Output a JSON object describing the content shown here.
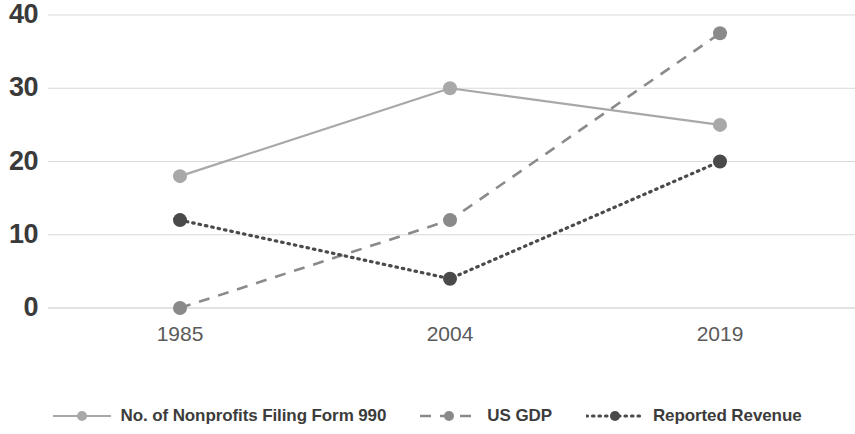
{
  "chart_data": {
    "type": "line",
    "title": "",
    "subtitle": "",
    "xlabel": "",
    "ylabel": "",
    "categories": [
      "1985",
      "2004",
      "2019"
    ],
    "x_tick_labels": [
      "1985",
      "2004",
      "2019"
    ],
    "y_tick_labels": [
      "0",
      "10",
      "20",
      "30",
      "40"
    ],
    "y_ticks": [
      0,
      10,
      20,
      30,
      40
    ],
    "ylim": [
      0,
      40
    ],
    "grid": "horizontal",
    "legend_position": "bottom",
    "series": [
      {
        "name": "No. of Nonprofits Filing Form 990",
        "values": [
          18,
          30,
          25
        ],
        "line_style": "solid",
        "color": "#a8a8a8",
        "marker": "circle"
      },
      {
        "name": "US GDP",
        "values": [
          0,
          12,
          37.5
        ],
        "line_style": "dashed",
        "color": "#8a8a8a",
        "marker": "circle"
      },
      {
        "name": "Reported Revenue",
        "values": [
          12,
          4,
          20
        ],
        "line_style": "dotted",
        "color": "#4a4a4a",
        "marker": "circle"
      }
    ]
  },
  "axis": {
    "y_labels": [
      "40",
      "30",
      "20",
      "10",
      "0"
    ],
    "x_labels": [
      "1985",
      "2004",
      "2019"
    ],
    "gridline_color": "#d9d9d9"
  },
  "legend": {
    "items": [
      {
        "label": "No. of Nonprofits Filing Form 990",
        "style": "solid",
        "color": "#a8a8a8"
      },
      {
        "label": "US GDP",
        "style": "dashed",
        "color": "#8a8a8a"
      },
      {
        "label": "Reported Revenue",
        "style": "dotted",
        "color": "#4a4a4a"
      }
    ]
  }
}
